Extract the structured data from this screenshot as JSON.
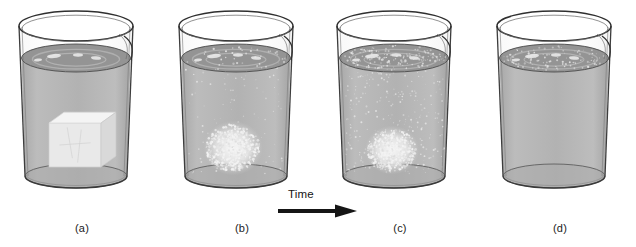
{
  "figure": {
    "type": "science-illustration-sequence",
    "background_color": "#ffffff",
    "width": 636,
    "height": 247
  },
  "timeline": {
    "label": "Time",
    "arrow_direction": "right",
    "arrow_color": "#151515"
  },
  "colors": {
    "water_body": "#b5b5b5",
    "water_surface_band": "#8e8e8e",
    "water_surface_top": "#9c9c9c",
    "glass_outline": "#3a3a3a",
    "glass_highlight": "#e8e8e8",
    "solid_crystal": "#e8e8e8",
    "crystal_shadow": "#c6c6c6",
    "particle": "#f2f2f2",
    "beaker_bottom": "#a9a9a9",
    "label_text": "#1b1b1b"
  },
  "panels": [
    {
      "id": "a",
      "label": "(a)",
      "x": 12,
      "caption_x": 52,
      "state": "undissolved-solid-cube",
      "solid": {
        "shape": "cube",
        "size": "large",
        "edges_visible": true,
        "center_x": 75,
        "center_y": 145,
        "width": 52,
        "height": 44
      },
      "particles_in_water": 0,
      "solution_tint": "none"
    },
    {
      "id": "b",
      "label": "(b)",
      "x": 172,
      "caption_x": 212,
      "state": "partially-dissolved-granular",
      "solid": {
        "shape": "eroded-granular-mound",
        "size": "medium",
        "edges_visible": false,
        "center_x": 233,
        "center_y": 148,
        "width": 48,
        "height": 38
      },
      "particles_in_water": 14,
      "solution_tint": "light"
    },
    {
      "id": "c",
      "label": "(c)",
      "x": 330,
      "caption_x": 370,
      "state": "mostly-dissolved-diffuse",
      "solid": {
        "shape": "diffuse-cloud",
        "size": "small",
        "edges_visible": false,
        "center_x": 392,
        "center_y": 150,
        "width": 44,
        "height": 34
      },
      "particles_in_water": 42,
      "solution_tint": "medium"
    },
    {
      "id": "d",
      "label": "(d)",
      "x": 490,
      "caption_x": 530,
      "state": "fully-dissolved-homogeneous-solution",
      "solid": null,
      "particles_in_water": 0,
      "solution_tint": "uniform"
    }
  ]
}
